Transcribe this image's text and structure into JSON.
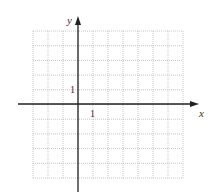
{
  "diagram": {
    "type": "coordinate-grid",
    "axes": {
      "x_label": "x",
      "y_label": "y",
      "x_unit_label": "1",
      "y_unit_label": "1"
    },
    "grid": {
      "columns": 10,
      "rows": 10,
      "x_range": [
        -3,
        7
      ],
      "y_range": [
        -5,
        5
      ],
      "line_style": "dotted"
    },
    "colors": {
      "axis": "#222222",
      "grid": "#b8b8b8",
      "text": "#333333"
    }
  }
}
